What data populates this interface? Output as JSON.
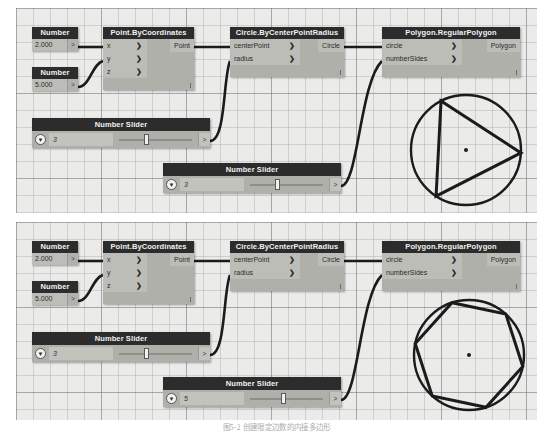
{
  "caption": "图5-2  创建限定边数的内接多边形",
  "colors": {
    "node_header": "#2c2c2c",
    "node_body": "#b0b0ab",
    "port_bg": "#bdbdb8",
    "canvas": "#ebebe9",
    "wire": "#1b1b1b"
  },
  "panels": [
    {
      "id": "top",
      "nodes": {
        "number_x": {
          "title": "Number",
          "value": "2.000",
          "connector": ">"
        },
        "number_y": {
          "title": "Number",
          "value": "5.000",
          "connector": ">"
        },
        "point": {
          "title": "Point.ByCoordinates",
          "inputs": [
            "x",
            "y",
            "z"
          ],
          "output": "Point",
          "chevron": "❯"
        },
        "circle": {
          "title": "Circle.ByCenterPointRadius",
          "inputs": [
            "centerPoint",
            "radius"
          ],
          "output": "Circle",
          "chevron": "❯"
        },
        "polygon": {
          "title": "Polygon.RegularPolygon",
          "inputs": [
            "circle",
            "numberSides"
          ],
          "output": "Polygon",
          "chevron": "❯"
        },
        "slider_radius": {
          "title": "Number Slider",
          "value": "3",
          "caret": "▼",
          "out": ">"
        },
        "slider_sides": {
          "title": "Number Slider",
          "value": "3",
          "caret": "▼",
          "out": ">"
        }
      },
      "geometry": {
        "shape": "polygon-in-circle",
        "sides": 3,
        "label": "triangle-in-circle"
      }
    },
    {
      "id": "bottom",
      "nodes": {
        "number_x": {
          "title": "Number",
          "value": "2.000",
          "connector": ">"
        },
        "number_y": {
          "title": "Number",
          "value": "5.000",
          "connector": ">"
        },
        "point": {
          "title": "Point.ByCoordinates",
          "inputs": [
            "x",
            "y",
            "z"
          ],
          "output": "Point",
          "chevron": "❯"
        },
        "circle": {
          "title": "Circle.ByCenterPointRadius",
          "inputs": [
            "centerPoint",
            "radius"
          ],
          "output": "Circle",
          "chevron": "❯"
        },
        "polygon": {
          "title": "Polygon.RegularPolygon",
          "inputs": [
            "circle",
            "numberSides"
          ],
          "output": "Polygon",
          "chevron": "❯"
        },
        "slider_radius": {
          "title": "Number Slider",
          "value": "3",
          "caret": "▼",
          "out": ">"
        },
        "slider_sides": {
          "title": "Number Slider",
          "value": "5",
          "caret": "▼",
          "out": ">"
        }
      },
      "geometry": {
        "shape": "polygon-in-circle",
        "sides": 6,
        "label": "hexagon-in-circle"
      }
    }
  ]
}
